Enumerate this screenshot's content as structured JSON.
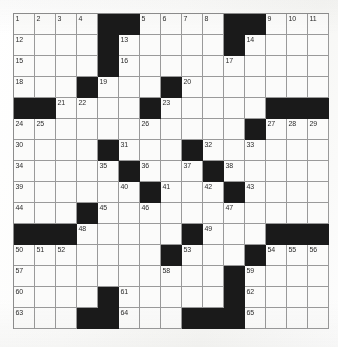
{
  "puzzle": {
    "title": "Crossword Grid",
    "type": "crossword",
    "rows": 15,
    "columns": 15,
    "cell_size_px": 21,
    "colors": {
      "block": "#1a1a1a",
      "open_cell": "#fbfbfa",
      "grid_line": "#9a9a9a",
      "number_text": "#2b2b2b",
      "paper": "#fdfdfc"
    },
    "highest_clue_number": 65,
    "grid": [
      [
        "1",
        "2",
        "3",
        "4",
        "#",
        "#",
        "5",
        "6",
        "7",
        "8",
        "#",
        "#",
        "9",
        "10",
        "11"
      ],
      [
        "12",
        "",
        "",
        "",
        "#",
        "13",
        "",
        "",
        "",
        "",
        "#",
        "14",
        "",
        "",
        ""
      ],
      [
        "15",
        "",
        "",
        "",
        "#",
        "16",
        "",
        "",
        "",
        "",
        "17",
        "",
        "",
        "",
        ""
      ],
      [
        "18",
        "",
        "",
        "#",
        "19",
        "",
        "",
        "#",
        "20",
        "",
        "",
        "",
        "",
        "",
        ""
      ],
      [
        "#",
        "#",
        "21",
        "22",
        "",
        "",
        "#",
        "23",
        "",
        "",
        "",
        "",
        "#",
        "#",
        "#"
      ],
      [
        "24",
        "25",
        "",
        "",
        "",
        "",
        "26",
        "",
        "",
        "",
        "",
        "#",
        "27",
        "28",
        "29"
      ],
      [
        "30",
        "",
        "",
        "",
        "#",
        "31",
        "",
        "",
        "#",
        "32",
        "",
        "33",
        "",
        "",
        ""
      ],
      [
        "34",
        "",
        "",
        "",
        "35",
        "#",
        "36",
        "",
        "37",
        "#",
        "38",
        "",
        "",
        "",
        ""
      ],
      [
        "39",
        "",
        "",
        "",
        "",
        "40",
        "#",
        "41",
        "",
        "42",
        "#",
        "43",
        "",
        "",
        ""
      ],
      [
        "44",
        "",
        "",
        "#",
        "45",
        "",
        "46",
        "",
        "",
        "",
        "47",
        "",
        "",
        "",
        ""
      ],
      [
        "#",
        "#",
        "#",
        "48",
        "",
        "",
        "",
        "",
        "#",
        "49",
        "",
        "",
        "#",
        "#",
        "#"
      ],
      [
        "50",
        "51",
        "52",
        "",
        "",
        "",
        "",
        "#",
        "53",
        "",
        "",
        "#",
        "54",
        "55",
        "56"
      ],
      [
        "57",
        "",
        "",
        "",
        "",
        "",
        "",
        "58",
        "",
        "",
        "#",
        "59",
        "",
        "",
        ""
      ],
      [
        "60",
        "",
        "",
        "",
        "#",
        "61",
        "",
        "",
        "",
        "",
        "#",
        "62",
        "",
        "",
        ""
      ],
      [
        "63",
        "",
        "",
        "#",
        "#",
        "64",
        "",
        "",
        "#",
        "#",
        "#",
        "65",
        "",
        "",
        ""
      ]
    ],
    "blocks": [
      [
        0,
        4
      ],
      [
        0,
        5
      ],
      [
        0,
        10
      ],
      [
        0,
        11
      ],
      [
        1,
        4
      ],
      [
        1,
        10
      ],
      [
        2,
        4
      ],
      [
        3,
        3
      ],
      [
        3,
        7
      ],
      [
        4,
        0
      ],
      [
        4,
        1
      ],
      [
        4,
        6
      ],
      [
        4,
        12
      ],
      [
        4,
        13
      ],
      [
        4,
        14
      ],
      [
        5,
        11
      ],
      [
        6,
        4
      ],
      [
        6,
        8
      ],
      [
        7,
        5
      ],
      [
        7,
        9
      ],
      [
        8,
        6
      ],
      [
        8,
        10
      ],
      [
        9,
        3
      ],
      [
        10,
        0
      ],
      [
        10,
        1
      ],
      [
        10,
        2
      ],
      [
        10,
        8
      ],
      [
        10,
        12
      ],
      [
        10,
        13
      ],
      [
        10,
        14
      ],
      [
        11,
        7
      ],
      [
        11,
        11
      ],
      [
        12,
        10
      ],
      [
        13,
        4
      ],
      [
        13,
        10
      ],
      [
        14,
        3
      ],
      [
        14,
        4
      ],
      [
        14,
        8
      ],
      [
        14,
        9
      ],
      [
        14,
        10
      ]
    ]
  }
}
